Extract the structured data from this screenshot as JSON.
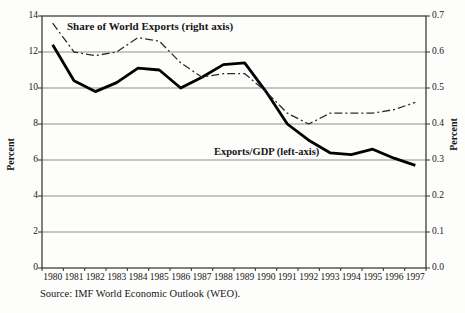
{
  "chart_data": {
    "type": "line",
    "categories": [
      "1980",
      "1981",
      "1982",
      "1983",
      "1984",
      "1985",
      "1986",
      "1987",
      "1988",
      "1989",
      "1990",
      "1991",
      "1992",
      "1993",
      "1994",
      "1995",
      "1996",
      "1997"
    ],
    "series": [
      {
        "name": "Exports/GDP (left-axis)",
        "axis": "left",
        "line_style": "solid",
        "color": "#000000",
        "values": [
          12.4,
          10.4,
          9.8,
          10.3,
          11.1,
          11.0,
          10.0,
          10.6,
          11.3,
          11.4,
          9.8,
          8.0,
          7.1,
          6.4,
          6.3,
          6.6,
          6.1,
          5.7
        ]
      },
      {
        "name": "Share of World Exports (right axis)",
        "axis": "right",
        "line_style": "dash-dot",
        "color": "#2b2b2b",
        "values": [
          0.68,
          0.6,
          0.59,
          0.6,
          0.64,
          0.63,
          0.57,
          0.53,
          0.54,
          0.54,
          0.49,
          0.43,
          0.4,
          0.43,
          0.43,
          0.43,
          0.44,
          0.46
        ]
      }
    ],
    "left_axis": {
      "title": "Percent",
      "min": 0,
      "max": 14,
      "tick_step": 2,
      "ticks": [
        "0",
        "2",
        "4",
        "6",
        "8",
        "10",
        "12",
        "14"
      ]
    },
    "right_axis": {
      "title": "Percent",
      "min": 0.0,
      "max": 0.7,
      "tick_step": 0.1,
      "ticks": [
        "0.0",
        "0.1",
        "0.2",
        "0.3",
        "0.4",
        "0.5",
        "0.6",
        "0.7"
      ]
    },
    "grid": true,
    "legend_position": "none (inline annotations)",
    "colors": {
      "grid": "#8f8f8f",
      "axis": "#2f2f2f"
    }
  },
  "annotations": {
    "share_label": "Share of World Exports (right axis)",
    "exports_label": "Exports/GDP (left-axis)"
  },
  "source": "Source: IMF World Economic Outlook (WEO)."
}
